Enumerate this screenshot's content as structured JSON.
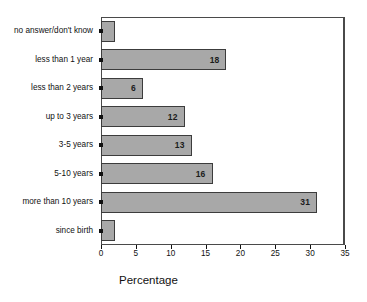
{
  "chart_data": {
    "type": "bar",
    "orientation": "horizontal",
    "title": "",
    "xlabel": "Percentage",
    "ylabel": "",
    "xlim": [
      0,
      35
    ],
    "xticks": [
      0,
      5,
      10,
      15,
      20,
      25,
      30,
      35
    ],
    "grid": false,
    "legend": false,
    "categories": [
      "no answer/don't know",
      "less than 1 year",
      "less than 2 years",
      "up to 3 years",
      "3-5 years",
      "5-10 years",
      "more than 10 years",
      "since birth"
    ],
    "values": [
      2,
      18,
      6,
      12,
      13,
      16,
      31,
      2
    ],
    "value_labels": [
      "",
      "18",
      "6",
      "12",
      "13",
      "16",
      "31",
      ""
    ],
    "bars": [
      {
        "category": "no answer/don't know",
        "value": 2,
        "label": ""
      },
      {
        "category": "less than 1 year",
        "value": 18,
        "label": "18"
      },
      {
        "category": "less than 2 years",
        "value": 6,
        "label": "6"
      },
      {
        "category": "up to 3 years",
        "value": 12,
        "label": "12"
      },
      {
        "category": "3-5 years",
        "value": 13,
        "label": "13"
      },
      {
        "category": "5-10 years",
        "value": 16,
        "label": "16"
      },
      {
        "category": "more than 10 years",
        "value": 31,
        "label": "31"
      },
      {
        "category": "since birth",
        "value": 2,
        "label": ""
      }
    ],
    "colors": {
      "bar_fill": "#a8a8a8",
      "bar_border": "#3c3c3c",
      "axis": "#4a4a4a",
      "text": "#111111",
      "background": "#ffffff"
    }
  }
}
